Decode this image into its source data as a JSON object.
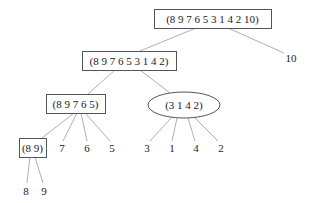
{
  "diagram": {
    "type": "tree",
    "nodes": [
      {
        "id": "root",
        "label": "(8 9 7 6 5 3 1 4 2 10)",
        "shape": "box",
        "x": 154,
        "y": 9,
        "w": 117,
        "h": 19
      },
      {
        "id": "n1",
        "label": "(8 9 7 6 5 3 1 4 2)",
        "shape": "box",
        "x": 82,
        "y": 51,
        "w": 94,
        "h": 19
      },
      {
        "id": "leaf10",
        "label": "10",
        "shape": "text",
        "cx": 291,
        "cy": 58
      },
      {
        "id": "n2",
        "label": "(8 9 7 6 5)",
        "shape": "box",
        "x": 46,
        "y": 94,
        "w": 59,
        "h": 19
      },
      {
        "id": "n3",
        "label": "(3 1 4 2)",
        "shape": "ellipse",
        "cx": 184,
        "cy": 105,
        "rx": 36,
        "ry": 13
      },
      {
        "id": "n4",
        "label": "(8 9)",
        "shape": "box",
        "x": 19,
        "y": 138,
        "w": 27,
        "h": 19
      },
      {
        "id": "leaf7",
        "label": "7",
        "shape": "text",
        "cx": 62,
        "cy": 148
      },
      {
        "id": "leaf6",
        "label": "6",
        "shape": "text",
        "cx": 87,
        "cy": 148
      },
      {
        "id": "leaf5",
        "label": "5",
        "shape": "text",
        "cx": 112,
        "cy": 148
      },
      {
        "id": "leaf3",
        "label": "3",
        "shape": "text",
        "cx": 147,
        "cy": 148
      },
      {
        "id": "leaf1",
        "label": "1",
        "shape": "text",
        "cx": 172,
        "cy": 148
      },
      {
        "id": "leaf4",
        "label": "4",
        "shape": "text",
        "cx": 196,
        "cy": 148
      },
      {
        "id": "leaf2",
        "label": "2",
        "shape": "text",
        "cx": 221,
        "cy": 148
      },
      {
        "id": "leaf8",
        "label": "8",
        "shape": "text",
        "cx": 26,
        "cy": 191
      },
      {
        "id": "leaf9",
        "label": "9",
        "shape": "text",
        "cx": 44,
        "cy": 191
      }
    ],
    "edges": [
      {
        "from": "root",
        "to": "n1",
        "x1": 196,
        "y1": 28,
        "x2": 140,
        "y2": 51
      },
      {
        "from": "root",
        "to": "leaf10",
        "x1": 228,
        "y1": 28,
        "x2": 284,
        "y2": 53
      },
      {
        "from": "n1",
        "to": "n2",
        "x1": 115,
        "y1": 70,
        "x2": 88,
        "y2": 94
      },
      {
        "from": "n1",
        "to": "n3",
        "x1": 140,
        "y1": 70,
        "x2": 170,
        "y2": 93
      },
      {
        "from": "n2",
        "to": "n4",
        "x1": 74,
        "y1": 113,
        "x2": 42,
        "y2": 138
      },
      {
        "from": "n2",
        "to": "leaf7",
        "x1": 77,
        "y1": 113,
        "x2": 63,
        "y2": 141
      },
      {
        "from": "n2",
        "to": "leaf6",
        "x1": 81,
        "y1": 113,
        "x2": 87,
        "y2": 141
      },
      {
        "from": "n2",
        "to": "leaf5",
        "x1": 85,
        "y1": 113,
        "x2": 110,
        "y2": 141
      },
      {
        "from": "n3",
        "to": "leaf3",
        "x1": 172,
        "y1": 117,
        "x2": 150,
        "y2": 141
      },
      {
        "from": "n3",
        "to": "leaf1",
        "x1": 177,
        "y1": 118,
        "x2": 172,
        "y2": 141
      },
      {
        "from": "n3",
        "to": "leaf4",
        "x1": 188,
        "y1": 118,
        "x2": 195,
        "y2": 141
      },
      {
        "from": "n3",
        "to": "leaf2",
        "x1": 194,
        "y1": 117,
        "x2": 218,
        "y2": 141
      },
      {
        "from": "n4",
        "to": "leaf8",
        "x1": 30,
        "y1": 157,
        "x2": 27,
        "y2": 183
      },
      {
        "from": "n4",
        "to": "leaf9",
        "x1": 35,
        "y1": 157,
        "x2": 43,
        "y2": 183
      }
    ]
  }
}
